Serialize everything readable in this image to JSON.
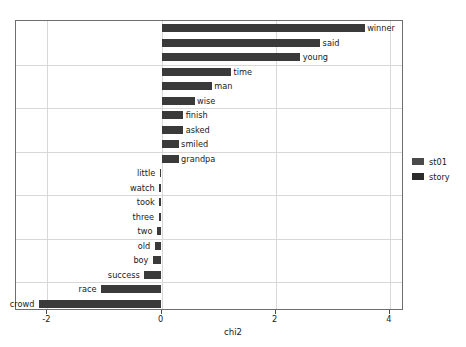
{
  "chart_data": {
    "type": "bar",
    "orientation": "horizontal",
    "title": "",
    "xlabel": "chi2",
    "ylabel": "",
    "xlim": [
      -2.55,
      4.25
    ],
    "xticks": [
      -2,
      0,
      2,
      4
    ],
    "xticklabels": [
      "-2",
      "0",
      "2",
      "4"
    ],
    "grid": true,
    "grid_axis": "both",
    "legend_position": "right",
    "categories": [
      "winner",
      "said",
      "young",
      "time",
      "man",
      "wise",
      "finish",
      "asked",
      "smiled",
      "grandpa",
      "little",
      "watch",
      "took",
      "three",
      "two",
      "old",
      "boy",
      "success",
      "race",
      "crowd"
    ],
    "values": [
      3.56,
      2.78,
      2.43,
      1.22,
      0.88,
      0.58,
      0.38,
      0.38,
      0.3,
      0.3,
      -0.03,
      -0.04,
      -0.04,
      -0.05,
      -0.08,
      -0.12,
      -0.15,
      -0.3,
      -1.06,
      -2.15
    ],
    "series": [
      {
        "name": "st01",
        "color": "#3a3a3a",
        "categories": [
          "winner",
          "said",
          "young",
          "time",
          "man",
          "wise",
          "finish",
          "asked",
          "smiled",
          "grandpa",
          "little",
          "watch",
          "took",
          "three",
          "two",
          "old",
          "boy",
          "success",
          "race",
          "crowd"
        ],
        "values": [
          3.56,
          2.78,
          2.43,
          1.22,
          0.88,
          0.58,
          0.38,
          0.38,
          0.3,
          0.3,
          -0.03,
          -0.04,
          -0.04,
          -0.05,
          -0.08,
          -0.12,
          -0.15,
          -0.3,
          -1.06,
          -2.15
        ]
      }
    ],
    "bars": [
      {
        "label": "winner",
        "value": 3.56
      },
      {
        "label": "said",
        "value": 2.78
      },
      {
        "label": "young",
        "value": 2.43
      },
      {
        "label": "time",
        "value": 1.22
      },
      {
        "label": "man",
        "value": 0.88
      },
      {
        "label": "wise",
        "value": 0.58
      },
      {
        "label": "finish",
        "value": 0.38
      },
      {
        "label": "asked",
        "value": 0.38
      },
      {
        "label": "smiled",
        "value": 0.3
      },
      {
        "label": "grandpa",
        "value": 0.3
      },
      {
        "label": "little",
        "value": -0.03
      },
      {
        "label": "watch",
        "value": -0.04
      },
      {
        "label": "took",
        "value": -0.04
      },
      {
        "label": "three",
        "value": -0.05
      },
      {
        "label": "two",
        "value": -0.08
      },
      {
        "label": "old",
        "value": -0.12
      },
      {
        "label": "boy",
        "value": -0.15
      },
      {
        "label": "success",
        "value": -0.3
      },
      {
        "label": "race",
        "value": -1.06
      },
      {
        "label": "crowd",
        "value": -2.15
      }
    ]
  },
  "legend": {
    "entries": [
      {
        "label": "st01",
        "color": "#4a4a4a"
      },
      {
        "label": "story",
        "color": "#2b2b2b"
      }
    ]
  },
  "colors": {
    "bar": "#3a3a3a",
    "grid": "#d8d8d8",
    "frame": "#6e6e6e",
    "text": "#1a1a1a",
    "background": "#ffffff"
  }
}
